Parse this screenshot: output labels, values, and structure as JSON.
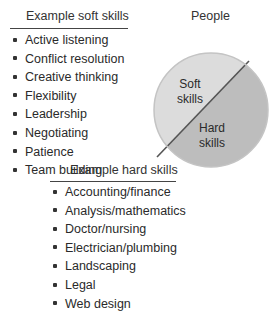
{
  "title": "People",
  "pie": {
    "segments": [
      {
        "label_line1": "Soft",
        "label_line2": "skills",
        "color": "#dcdcdc"
      },
      {
        "label_line1": "Hard",
        "label_line2": "skills",
        "color": "#bdbdbd"
      }
    ],
    "divider_color": "#555555",
    "border_color": "#c8c8c8"
  },
  "soft_skills": {
    "heading": "Example soft skills",
    "items": [
      "Active listening",
      "Conflict resolution",
      "Creative thinking",
      "Flexibility",
      "Leadership",
      "Negotiating",
      "Patience",
      "Team building"
    ]
  },
  "hard_skills": {
    "heading": "Example hard skills",
    "items": [
      "Accounting/finance",
      "Analysis/mathematics",
      "Doctor/nursing",
      "Electrician/plumbing",
      "Landscaping",
      "Legal",
      "Web design"
    ]
  }
}
